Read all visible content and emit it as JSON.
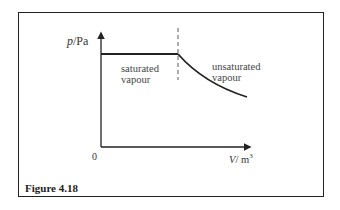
{
  "figure": {
    "caption": "Figure 4.18",
    "y_axis_label_var": "p",
    "y_axis_label_unit": "/Pa",
    "x_axis_label_var": "V",
    "x_axis_label_unit": "/ m",
    "x_axis_label_exp": "3",
    "origin_label": "0",
    "region_left_line1": "saturated",
    "region_left_line2": "vapour",
    "region_right_line1": "unsaturated",
    "region_right_line2": "vapour",
    "colors": {
      "line": "#222222",
      "text": "#333333",
      "background": "#ffffff"
    }
  }
}
